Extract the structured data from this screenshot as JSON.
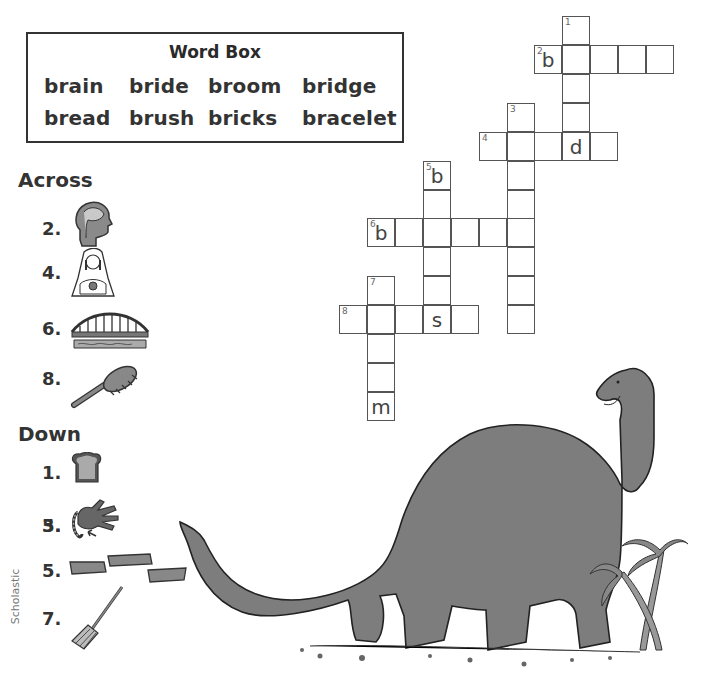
{
  "word_box": {
    "title": "Word Box",
    "words": [
      "brain",
      "bride",
      "broom",
      "bridge",
      "bread",
      "brush",
      "bricks",
      "bracelet"
    ]
  },
  "across": {
    "heading": "Across",
    "clues": [
      {
        "number": "2.",
        "picture": "brain-head-icon"
      },
      {
        "number": "4.",
        "picture": "bride-icon"
      },
      {
        "number": "6.",
        "picture": "bridge-icon"
      },
      {
        "number": "8.",
        "picture": "hairbrush-icon"
      }
    ]
  },
  "down": {
    "heading": "Down",
    "clues": [
      {
        "number": "1.",
        "picture": "bread-slice-icon"
      },
      {
        "number": "3.",
        "picture": "hand-bracelet-icon"
      },
      {
        "number": "5.",
        "picture": "bricks-icon"
      },
      {
        "number": "7.",
        "picture": "broom-icon"
      }
    ]
  },
  "grid": {
    "cells": [
      {
        "x": 562,
        "y": 16,
        "n": "1",
        "l": ""
      },
      {
        "x": 534,
        "y": 45,
        "n": "2",
        "l": "b"
      },
      {
        "x": 562,
        "y": 45,
        "n": "",
        "l": ""
      },
      {
        "x": 590,
        "y": 45,
        "n": "",
        "l": ""
      },
      {
        "x": 618,
        "y": 45,
        "n": "",
        "l": ""
      },
      {
        "x": 646,
        "y": 45,
        "n": "",
        "l": ""
      },
      {
        "x": 562,
        "y": 74,
        "n": "",
        "l": ""
      },
      {
        "x": 562,
        "y": 103,
        "n": "",
        "l": ""
      },
      {
        "x": 507,
        "y": 103,
        "n": "3",
        "l": ""
      },
      {
        "x": 479,
        "y": 132,
        "n": "4",
        "l": ""
      },
      {
        "x": 507,
        "y": 132,
        "n": "",
        "l": ""
      },
      {
        "x": 534,
        "y": 132,
        "n": "",
        "l": ""
      },
      {
        "x": 562,
        "y": 132,
        "n": "",
        "l": "d"
      },
      {
        "x": 590,
        "y": 132,
        "n": "",
        "l": ""
      },
      {
        "x": 507,
        "y": 161,
        "n": "",
        "l": ""
      },
      {
        "x": 423,
        "y": 161,
        "n": "5",
        "l": "b"
      },
      {
        "x": 507,
        "y": 190,
        "n": "",
        "l": ""
      },
      {
        "x": 423,
        "y": 190,
        "n": "",
        "l": ""
      },
      {
        "x": 367,
        "y": 218,
        "n": "6",
        "l": "b"
      },
      {
        "x": 395,
        "y": 218,
        "n": "",
        "l": ""
      },
      {
        "x": 423,
        "y": 218,
        "n": "",
        "l": ""
      },
      {
        "x": 451,
        "y": 218,
        "n": "",
        "l": ""
      },
      {
        "x": 479,
        "y": 218,
        "n": "",
        "l": ""
      },
      {
        "x": 507,
        "y": 218,
        "n": "",
        "l": ""
      },
      {
        "x": 423,
        "y": 247,
        "n": "",
        "l": ""
      },
      {
        "x": 507,
        "y": 247,
        "n": "",
        "l": ""
      },
      {
        "x": 423,
        "y": 276,
        "n": "",
        "l": ""
      },
      {
        "x": 507,
        "y": 276,
        "n": "",
        "l": ""
      },
      {
        "x": 367,
        "y": 276,
        "n": "7",
        "l": ""
      },
      {
        "x": 339,
        "y": 305,
        "n": "8",
        "l": ""
      },
      {
        "x": 367,
        "y": 305,
        "n": "",
        "l": ""
      },
      {
        "x": 395,
        "y": 305,
        "n": "",
        "l": ""
      },
      {
        "x": 423,
        "y": 305,
        "n": "",
        "l": "s"
      },
      {
        "x": 451,
        "y": 305,
        "n": "",
        "l": ""
      },
      {
        "x": 507,
        "y": 305,
        "n": "",
        "l": ""
      },
      {
        "x": 367,
        "y": 334,
        "n": "",
        "l": ""
      },
      {
        "x": 367,
        "y": 363,
        "n": "",
        "l": ""
      },
      {
        "x": 367,
        "y": 392,
        "n": "",
        "l": "m"
      }
    ]
  },
  "credit": "Scholastic",
  "illustration": "brontosaurus-with-palm-trees"
}
